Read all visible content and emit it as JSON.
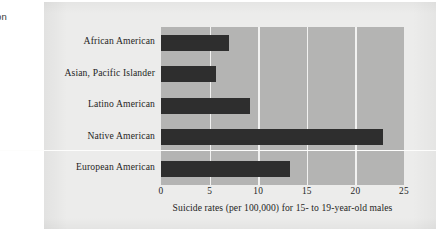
{
  "margin_note": {
    "lines": [
      "mon",
      "es"
    ]
  },
  "chart_data": {
    "type": "bar",
    "orientation": "horizontal",
    "title": "",
    "xlabel": "Suicide rates (per 100,000) for 15- to 19-year-old males",
    "ylabel": "",
    "categories": [
      "African American",
      "Asian, Pacific Islander",
      "Latino American",
      "Native American",
      "European American"
    ],
    "values": [
      7.0,
      5.7,
      9.2,
      22.8,
      13.3
    ],
    "xlim": [
      0,
      25
    ],
    "xticks": [
      0,
      5,
      10,
      15,
      20,
      25
    ],
    "xtick_labels": [
      "0",
      "5",
      "10",
      "15",
      "20",
      "25"
    ],
    "grid": true,
    "legend": false,
    "colors": {
      "bar": "#2e2e2e",
      "plot_background": "#b4b4b3",
      "figure_background": "#ececeb",
      "gridline": "#f2f2f1",
      "text": "#1f1f1e"
    }
  }
}
